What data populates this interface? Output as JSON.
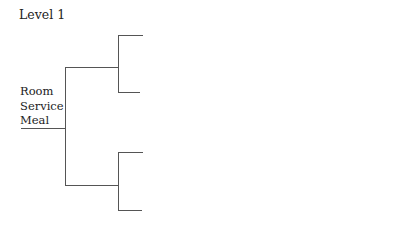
{
  "title": "Level 1",
  "tree": {
    "root": {
      "label_lines": [
        "Room",
        "Service",
        "Meal"
      ],
      "children": [
        {
          "label": "",
          "children": [
            {
              "label": ""
            },
            {
              "label": ""
            }
          ]
        },
        {
          "label": "",
          "children": [
            {
              "label": ""
            },
            {
              "label": ""
            }
          ]
        }
      ]
    }
  },
  "colors": {
    "line": "#555555",
    "text": "#222222",
    "background": "#ffffff"
  }
}
